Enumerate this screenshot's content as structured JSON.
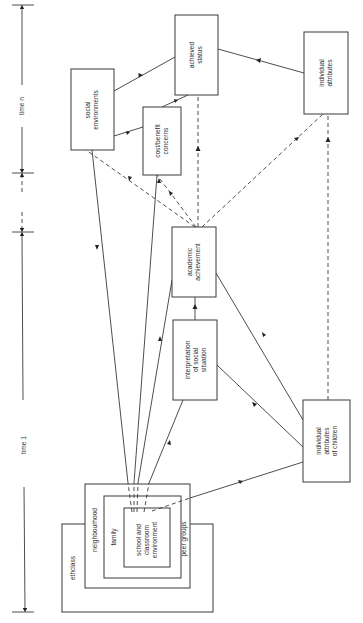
{
  "diagram": {
    "timeline": {
      "time_n_label": "time n",
      "time_1_label": "time 1"
    },
    "nodes": {
      "social_environments": [
        "social",
        "environments"
      ],
      "achieved_status": [
        "achieved",
        "status"
      ],
      "cost_benefit": [
        "cost/benefit",
        "concerns"
      ],
      "individual_attributes": [
        "individual",
        "attributes"
      ],
      "academic_achievement": [
        "academic",
        "achievement"
      ],
      "interpretation": [
        "interpretation",
        "of social",
        "situation"
      ],
      "individual_attributes_children": [
        "individual",
        "attributes",
        "of children"
      ],
      "ethclass": "ethclass",
      "neighbourhood": "neighbourhood",
      "family": "family",
      "school": [
        "school and",
        "classroom",
        "environment"
      ],
      "peer_groups": "peer groups"
    },
    "colors": {
      "line": "#3a3a3a",
      "background": "#ffffff"
    }
  }
}
